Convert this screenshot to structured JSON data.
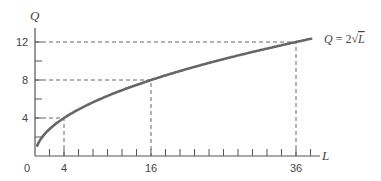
{
  "chart_data": {
    "type": "line",
    "title": "",
    "xlabel": "L",
    "ylabel": "Q",
    "curve_label": "Q = 2√L",
    "function": "Q = 2*sqrt(L)",
    "x": [
      0.5,
      1,
      2,
      4,
      8,
      16,
      24,
      36,
      38
    ],
    "values": [
      1.41,
      2,
      2.83,
      4,
      5.66,
      8,
      9.8,
      12,
      12.33
    ],
    "highlighted_points": [
      {
        "L": 4,
        "Q": 4
      },
      {
        "L": 16,
        "Q": 8
      },
      {
        "L": 36,
        "Q": 12
      }
    ],
    "x_tick_labels": [
      "0",
      "4",
      "16",
      "36"
    ],
    "y_tick_labels": [
      "4",
      "8",
      "12"
    ],
    "xlim": [
      0,
      40
    ],
    "ylim": [
      0,
      14
    ],
    "grid": false,
    "legend": "none"
  },
  "labels": {
    "q_axis": "Q",
    "l_axis": "L",
    "origin": "0",
    "x4": "4",
    "x16": "16",
    "x36": "36",
    "y4": "4",
    "y8": "8",
    "y12": "12",
    "curve_q": "Q",
    "curve_eq": " = 2√",
    "curve_l": "L"
  }
}
